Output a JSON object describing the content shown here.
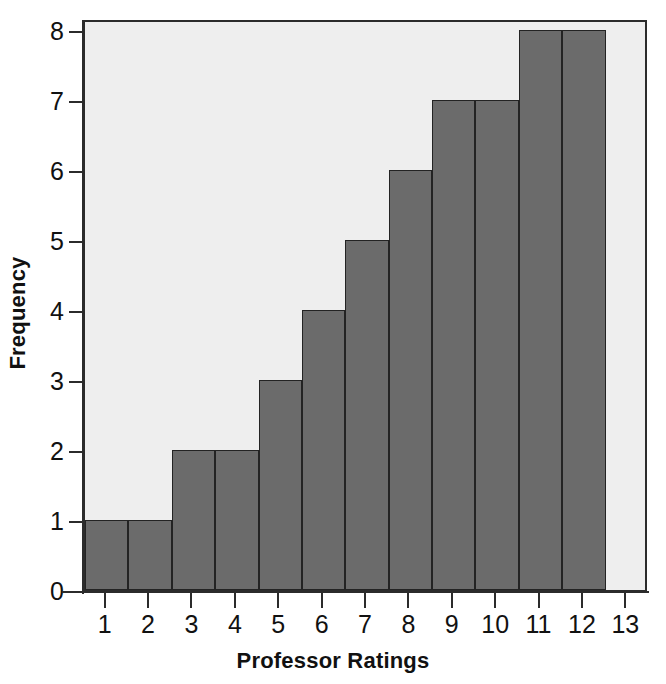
{
  "chart_data": {
    "type": "bar",
    "title": "",
    "xlabel": "Professor Ratings",
    "ylabel": "Frequency",
    "categories": [
      "1",
      "2",
      "3",
      "4",
      "5",
      "6",
      "7",
      "8",
      "9",
      "10",
      "11",
      "12",
      "13"
    ],
    "values": [
      1,
      1,
      2,
      2,
      3,
      4,
      5,
      6,
      7,
      7,
      8,
      8,
      0
    ],
    "x_tick_labels": [
      "1",
      "2",
      "3",
      "4",
      "5",
      "6",
      "7",
      "8",
      "9",
      "10",
      "11",
      "12",
      "13"
    ],
    "y_tick_labels": [
      "0",
      "1",
      "2",
      "3",
      "4",
      "5",
      "6",
      "7",
      "8"
    ],
    "y_tick_values": [
      0,
      1,
      2,
      3,
      4,
      5,
      6,
      7,
      8
    ],
    "ylim": [
      0,
      8.2
    ],
    "xlim": [
      0.5,
      13.5
    ],
    "grid": false,
    "legend": null,
    "bar_color": "#6b6b6b",
    "bar_edge_color": "#232323",
    "plot_background_color": "#eeeeee",
    "axis_color": "#2b2b2b",
    "text_color": "#111111"
  },
  "axes": {
    "y_title": "Frequency",
    "x_title": "Professor Ratings"
  }
}
